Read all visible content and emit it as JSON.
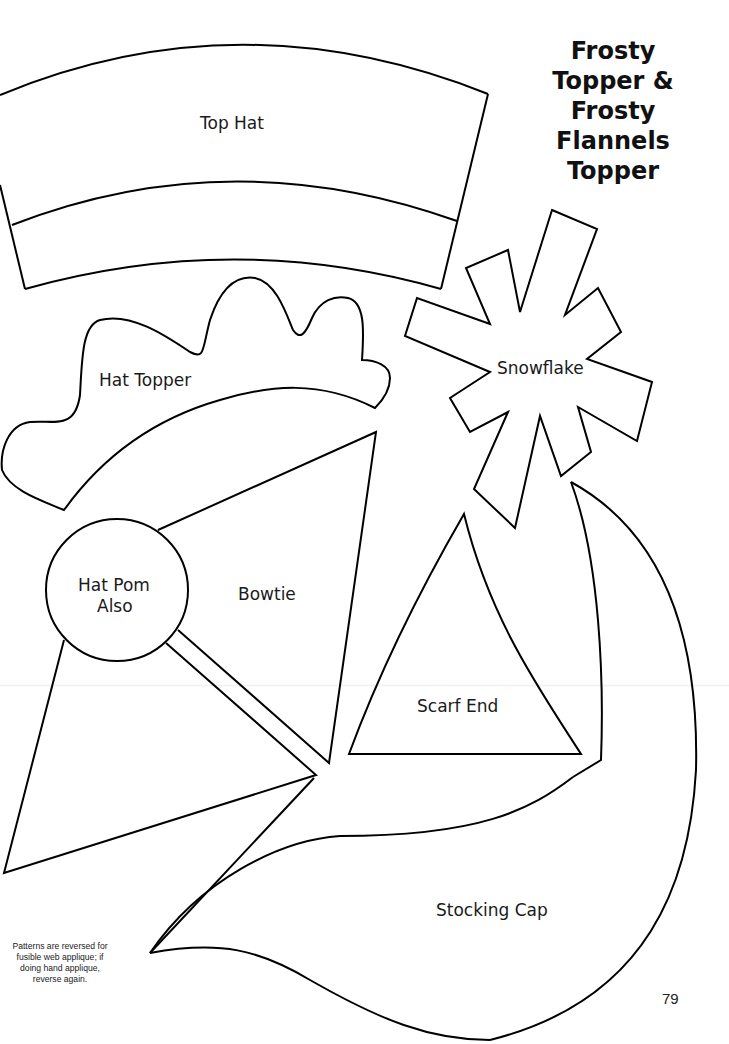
{
  "title": {
    "lines": [
      "Frosty",
      "Topper &",
      "Frosty",
      "Flannels",
      "Topper"
    ]
  },
  "pieces": {
    "top_hat": "Top Hat",
    "hat_topper": "Hat Topper",
    "snowflake": "Snowflake",
    "hat_pom_line1": "Hat Pom",
    "hat_pom_line2": "Also",
    "bowtie": "Bowtie",
    "scarf_end": "Scarf End",
    "stocking_cap": "Stocking Cap"
  },
  "note": {
    "lines": [
      "Patterns are reversed for",
      "fusible web applique; if",
      "doing hand applique,",
      "reverse again."
    ]
  },
  "page_number": "79",
  "colors": {
    "outline": "#000000",
    "background": "#ffffff"
  }
}
